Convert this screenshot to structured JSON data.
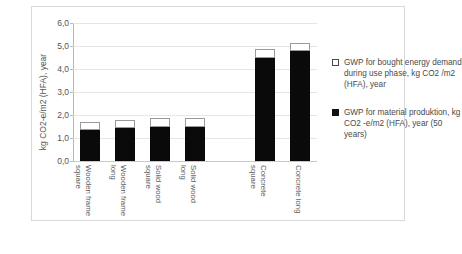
{
  "chart_data": {
    "type": "bar",
    "title": "",
    "xlabel": "",
    "ylabel": "kg CO2-e/m2 (HFA), year",
    "ylim": [
      0.0,
      6.0
    ],
    "ytick_labels": [
      "6,0",
      "5,0",
      "4,0",
      "3,0",
      "2,0",
      "1,0",
      "0,0"
    ],
    "ytick_values": [
      6.0,
      5.0,
      4.0,
      3.0,
      2.0,
      1.0,
      0.0
    ],
    "grid": true,
    "stacked": true,
    "legend_position": "right",
    "categories": [
      "Wooden frame square",
      "Wooden frame long",
      "Solid wood square",
      "Solid wood long",
      "",
      "Concrete square",
      "Concrete long"
    ],
    "category_lines": [
      [
        "Wooden frame",
        "square"
      ],
      [
        "Wooden frame",
        "long"
      ],
      [
        "Solid wood",
        "square"
      ],
      [
        "Solid wood",
        "long"
      ],
      [
        "",
        ""
      ],
      [
        "Concrete",
        "square"
      ],
      [
        "Concrete long",
        ""
      ]
    ],
    "series": [
      {
        "name": "GWP for material produktion, kg CO2 -e/m2 (HFA), year (50 years)",
        "color": "#111111",
        "values": [
          1.35,
          1.45,
          1.5,
          1.5,
          null,
          4.5,
          4.8
        ]
      },
      {
        "name": "GWP for bought energy demand during use phase, kg CO2 /m2 (HFA), year",
        "color": "#ffffff",
        "values": [
          0.35,
          0.35,
          0.35,
          0.35,
          null,
          0.35,
          0.35
        ]
      }
    ],
    "totals": [
      1.7,
      1.8,
      1.85,
      1.85,
      null,
      4.85,
      5.15
    ]
  },
  "legend": {
    "entries": [
      {
        "marker": "open-square-marker",
        "label": "GWP for bought energy demand during use phase, kg CO2 /m2 (HFA), year"
      },
      {
        "marker": "filled-square-marker",
        "label": "GWP for material produktion, kg CO2 -e/m2 (HFA), year (50 years)"
      }
    ]
  },
  "colors": {
    "material_production": "#111111",
    "energy_demand": "#ffffff",
    "gridline": "#e6e6e6",
    "axis": "#b7b7b7",
    "frame": "#d9d9d9",
    "text": "#4a4a4a"
  }
}
